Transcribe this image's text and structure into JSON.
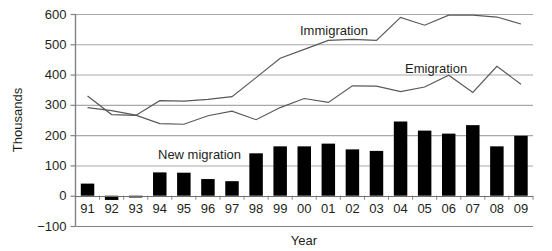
{
  "chart_data": {
    "type": "bar",
    "title": "",
    "subtitle": "",
    "xlabel": "Year",
    "ylabel": "Thousands",
    "categories": [
      "91",
      "92",
      "93",
      "94",
      "95",
      "96",
      "97",
      "98",
      "99",
      "00",
      "01",
      "02",
      "03",
      "04",
      "05",
      "06",
      "07",
      "08",
      "09"
    ],
    "xlim_labels": [
      "91",
      "09"
    ],
    "ylim": [
      -100,
      600
    ],
    "yticks": [
      -100,
      0,
      100,
      200,
      300,
      400,
      500,
      600
    ],
    "ytick_labels": [
      "−100",
      "0",
      "100",
      "200",
      "300",
      "400",
      "500",
      "600"
    ],
    "grid": true,
    "legend_position": "inline-annotations",
    "series": [
      {
        "name": "New migration",
        "type": "bar",
        "color": "#000000",
        "values": [
          40,
          -14,
          -6,
          77,
          76,
          55,
          48,
          140,
          163,
          163,
          172,
          153,
          148,
          245,
          215,
          205,
          233,
          163,
          198
        ]
      },
      {
        "name": "Immigration",
        "type": "line",
        "color": "#58595b",
        "values": [
          329,
          268,
          265,
          314,
          312,
          318,
          327,
          390,
          454,
          483,
          513,
          516,
          513,
          589,
          563,
          596,
          596,
          590,
          567
        ]
      },
      {
        "name": "Emigration",
        "type": "line",
        "color": "#58595b",
        "values": [
          291,
          281,
          266,
          238,
          236,
          264,
          279,
          251,
          291,
          321,
          308,
          363,
          362,
          344,
          359,
          398,
          341,
          427,
          368
        ]
      }
    ],
    "annotations": [
      {
        "text": "Immigration",
        "x_category": "02",
        "value": 553
      },
      {
        "text": "Emigration",
        "x_category": "05",
        "value": 430
      },
      {
        "text": "New migration",
        "x_category": "96",
        "value": 140
      }
    ]
  },
  "axes": {
    "y_title": "Thousands",
    "x_title": "Year"
  }
}
